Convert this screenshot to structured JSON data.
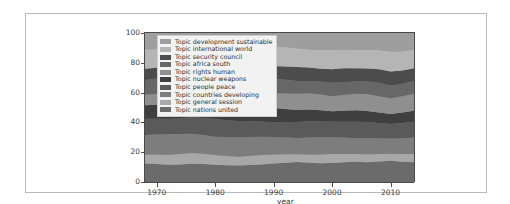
{
  "figure": {
    "background": "#ffffff",
    "frame_color": "#b9b9b9"
  },
  "chart_data": {
    "type": "area",
    "title": "",
    "subtitle": "",
    "xlabel": "year",
    "ylabel": "",
    "stacked": true,
    "stack_total": 100,
    "grid": false,
    "legend_position": "upper-left",
    "xlim": [
      1968,
      2014
    ],
    "ylim": [
      0,
      100
    ],
    "xticks": [
      1970,
      1980,
      1990,
      2000,
      2010
    ],
    "xtick_labels": [
      "1970",
      "1980",
      "1990",
      "2000",
      "2010"
    ],
    "yticks": [
      0,
      20,
      40,
      60,
      80,
      100
    ],
    "ytick_labels": [
      "0",
      "20",
      "40",
      "60",
      "80",
      "100"
    ],
    "x": [
      1968,
      1970,
      1972,
      1974,
      1976,
      1978,
      1980,
      1982,
      1984,
      1986,
      1988,
      1990,
      1992,
      1994,
      1996,
      1998,
      2000,
      2002,
      2004,
      2006,
      2008,
      2010,
      2012,
      2014
    ],
    "series": [
      {
        "name": "Topic nations united",
        "color": "#6b6b6b",
        "values": [
          12.5,
          12.0,
          11.5,
          11.8,
          12.2,
          12.0,
          11.6,
          11.2,
          11.0,
          11.4,
          11.8,
          12.4,
          13.0,
          13.4,
          13.0,
          12.6,
          12.8,
          13.2,
          13.6,
          13.2,
          13.8,
          14.2,
          13.6,
          13.2
        ]
      },
      {
        "name": "Topic general session",
        "color": "#a8a8a8",
        "values": [
          6.0,
          6.4,
          6.8,
          7.0,
          7.2,
          7.0,
          6.6,
          6.2,
          6.0,
          6.2,
          6.4,
          6.0,
          5.6,
          5.2,
          5.4,
          5.8,
          6.0,
          5.6,
          5.2,
          5.4,
          5.0,
          4.8,
          5.2,
          5.6
        ]
      },
      {
        "name": "Topic countries developing",
        "color": "#7d7d7d",
        "values": [
          13.0,
          13.4,
          13.8,
          13.4,
          13.0,
          12.6,
          12.2,
          12.6,
          13.0,
          12.6,
          12.2,
          11.8,
          11.4,
          11.0,
          11.4,
          11.8,
          11.4,
          11.0,
          10.6,
          11.0,
          10.6,
          10.2,
          10.6,
          11.0
        ]
      },
      {
        "name": "Topic people peace",
        "color": "#5a5a5a",
        "values": [
          11.0,
          10.6,
          10.2,
          10.6,
          11.0,
          11.4,
          11.8,
          11.4,
          11.0,
          10.6,
          10.2,
          9.8,
          10.2,
          10.6,
          11.0,
          10.6,
          10.2,
          10.6,
          11.0,
          10.6,
          10.2,
          9.8,
          10.2,
          10.6
        ]
      },
      {
        "name": "Topic nuclear weapons",
        "color": "#3f3f3f",
        "values": [
          9.0,
          9.4,
          9.8,
          10.2,
          10.6,
          11.0,
          11.4,
          11.8,
          11.4,
          11.0,
          10.4,
          9.6,
          8.8,
          8.2,
          7.8,
          7.4,
          7.0,
          7.4,
          7.8,
          7.4,
          7.0,
          6.6,
          7.0,
          7.4
        ]
      },
      {
        "name": "Topic rights human",
        "color": "#8f8f8f",
        "values": [
          7.0,
          7.2,
          7.4,
          7.6,
          7.8,
          8.0,
          8.2,
          8.4,
          8.8,
          9.2,
          9.6,
          10.0,
          10.4,
          10.8,
          11.0,
          10.6,
          10.2,
          10.6,
          11.0,
          11.4,
          11.0,
          10.6,
          11.0,
          11.4
        ]
      },
      {
        "name": "Topic africa south",
        "color": "#676767",
        "values": [
          10.0,
          10.4,
          10.8,
          11.2,
          11.6,
          12.0,
          12.4,
          12.0,
          11.6,
          11.0,
          10.4,
          9.8,
          9.2,
          8.6,
          8.2,
          8.6,
          9.0,
          8.6,
          8.2,
          8.6,
          9.0,
          8.6,
          8.2,
          8.6
        ]
      },
      {
        "name": "Topic security council",
        "color": "#4c4c4c",
        "values": [
          7.5,
          7.2,
          7.0,
          6.8,
          6.6,
          6.4,
          6.2,
          6.6,
          7.0,
          7.4,
          7.8,
          8.4,
          9.0,
          9.4,
          9.0,
          8.6,
          9.0,
          9.4,
          9.0,
          8.6,
          9.0,
          9.4,
          9.0,
          8.6
        ]
      },
      {
        "name": "Topic international world",
        "color": "#b5b5b5",
        "values": [
          13.0,
          12.6,
          12.2,
          11.8,
          11.4,
          11.0,
          11.4,
          11.8,
          12.2,
          12.6,
          13.0,
          13.4,
          13.0,
          12.6,
          12.2,
          12.6,
          13.0,
          12.6,
          12.2,
          12.6,
          13.0,
          13.4,
          13.0,
          12.6
        ]
      },
      {
        "name": "Topic development sustainable",
        "color": "#9e9e9e",
        "values": [
          11.0,
          10.8,
          10.5,
          9.6,
          8.6,
          8.6,
          8.2,
          8.0,
          8.0,
          8.0,
          8.2,
          8.8,
          9.4,
          10.2,
          11.0,
          11.4,
          11.4,
          11.0,
          11.4,
          11.2,
          11.4,
          12.4,
          12.2,
          11.0
        ]
      }
    ],
    "legend_entries": [
      {
        "label": "Topic development sustainable",
        "color": "#9e9e9e"
      },
      {
        "label": "Topic international world",
        "color": "#b5b5b5"
      },
      {
        "label": "Topic security council",
        "color": "#4c4c4c"
      },
      {
        "label": "Topic africa south",
        "color": "#676767"
      },
      {
        "label": "Topic rights human",
        "color": "#8f8f8f"
      },
      {
        "label": "Topic nuclear weapons",
        "color": "#3f3f3f"
      },
      {
        "label": "Topic people peace",
        "color": "#5a5a5a"
      },
      {
        "label": "Topic countries developing",
        "color": "#7d7d7d"
      },
      {
        "label": "Topic general session",
        "color": "#a8a8a8"
      },
      {
        "label": "Topic nations united",
        "color": "#6b6b6b"
      }
    ]
  }
}
